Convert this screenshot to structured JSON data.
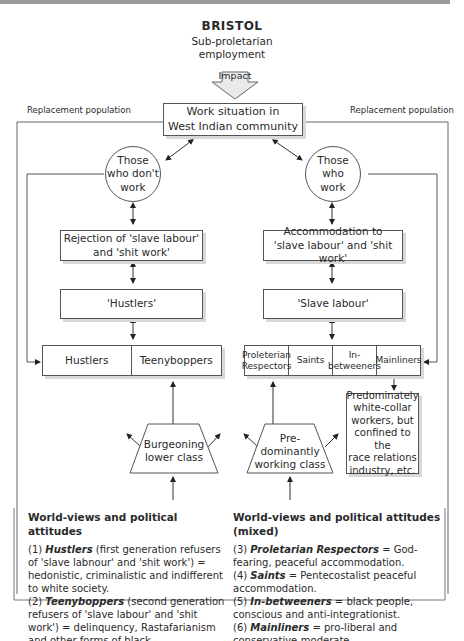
{
  "title": "BRISTOL",
  "subtitle_line1": "Sub-proletarian",
  "subtitle_line2": "employment",
  "impact_label": "Impact",
  "replacement_left": "Replacement population",
  "replacement_right": "Replacement population",
  "work_situation_line1": "Work situation in",
  "work_situation_line2": "West Indian community",
  "left": {
    "circle_line1": "Those",
    "circle_line2": "who don't",
    "circle_line3": "work",
    "rejection_line1": "Rejection of  'slave labour'",
    "rejection_line2": "and 'shit work'",
    "hustlers_box": "'Hustlers'",
    "groups": [
      "Hustlers",
      "Teenyboppers"
    ],
    "class_line1": "Burgeoning",
    "class_line2": "lower class"
  },
  "right": {
    "circle_line1": "Those",
    "circle_line2": "who",
    "circle_line3": "work",
    "accommodation_line1": "Accommodation to",
    "accommodation_line2": "'slave labour' and 'shit work'",
    "slave_box": "'Slave labour'",
    "groups": [
      {
        "l1": "Proleterian",
        "l2": "Respectors"
      },
      {
        "l1": "Saints",
        "l2": ""
      },
      {
        "l1": "In-",
        "l2": "betweeners"
      },
      {
        "l1": "Mainliners",
        "l2": ""
      }
    ],
    "class_line1": "Pre-",
    "class_line2": "dominantly",
    "class_line3": "working class",
    "whitecollar_lines": [
      "Predominately",
      "white-collar",
      "workers, but",
      "confined to the",
      "race relations",
      "industry, etc."
    ]
  },
  "legend_left": {
    "heading": "World-views and political attitudes",
    "item1_num": "(1) ",
    "item1_term": "Hustlers",
    "item1_text": " (first generation refusers of 'slave labnour' and 'shit work') = hedonistic, criminalistic and indifferent to white society.",
    "item2_num": "(2) ",
    "item2_term": "Teenyboppers",
    "item2_text": " (second generation refusers of 'slave labour' and 'shit work') = delinquency, Rastafarianism and other forms of black consciousness."
  },
  "legend_right": {
    "heading": "World-views and political attitudes (mixed)",
    "item3_num": "(3) ",
    "item3_term": "Proletarian Respectors",
    "item3_text": " = God-fearing, peaceful accommodation.",
    "item4_num": "(4) ",
    "item4_term": "Saints",
    "item4_text": " = Pentecostalist  peaceful accommodation.",
    "item5_num": "(5) ",
    "item5_term": "In-betweeners",
    "item5_text": " = black people, conscious and anti-integrationist.",
    "item6_num": "(6) ",
    "item6_term": "Mainliners",
    "item6_text": " = pro-liberal and conservative-moderate."
  }
}
